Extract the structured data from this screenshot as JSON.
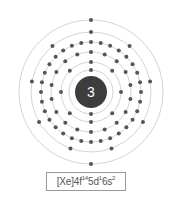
{
  "diagram": {
    "type": "bohr-model",
    "nucleus": {
      "label": "3",
      "color": "#3d3d3d",
      "text_color": "#ffffff"
    },
    "shells": [
      {
        "electrons": 2,
        "radius": 22
      },
      {
        "electrons": 8,
        "radius": 30
      },
      {
        "electrons": 18,
        "radius": 40
      },
      {
        "electrons": 32,
        "radius": 50
      },
      {
        "electrons": 9,
        "radius": 60
      },
      {
        "electrons": 2,
        "radius": 72
      }
    ],
    "ring_color": "#c8c8c8",
    "electron_color": "#555555",
    "electron_configuration": {
      "base": "[Xe]",
      "parts": [
        {
          "orbital": "4f",
          "count": "14"
        },
        {
          "orbital": "5d",
          "count": "1"
        },
        {
          "orbital": "6s",
          "count": "2"
        }
      ]
    }
  }
}
